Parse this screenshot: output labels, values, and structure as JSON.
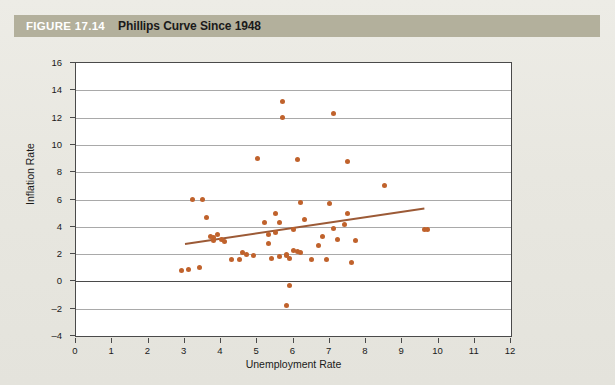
{
  "figure": {
    "label": "FIGURE 17.14",
    "title": "Phillips Curve Since 1948"
  },
  "colors": {
    "title_bar": "#b3b09c",
    "point": "#c0622c",
    "trend_line": "#9c5a36",
    "grid": "#a9a9a9",
    "axis": "#4a4a4a",
    "panel": "#ffffff",
    "page": "#e9e8e1"
  },
  "chart_data": {
    "type": "scatter",
    "title": "Phillips Curve Since 1948",
    "xlabel": "Unemployment Rate",
    "ylabel": "Inflation Rate",
    "xlim": [
      0,
      12
    ],
    "ylim": [
      -4,
      16
    ],
    "xticks": [
      0,
      1,
      2,
      3,
      4,
      5,
      6,
      7,
      8,
      9,
      10,
      11,
      12
    ],
    "yticks": [
      -4,
      -2,
      0,
      2,
      4,
      6,
      8,
      10,
      12,
      14,
      16
    ],
    "grid": "horizontal",
    "legend": null,
    "series": [
      {
        "name": "Annual observations",
        "marker": "circle",
        "color": "#c0622c",
        "points": [
          [
            2.9,
            0.8
          ],
          [
            3.1,
            0.9
          ],
          [
            3.2,
            6.0
          ],
          [
            3.4,
            1.0
          ],
          [
            3.5,
            6.0
          ],
          [
            3.6,
            4.7
          ],
          [
            3.7,
            3.3
          ],
          [
            3.8,
            3.2
          ],
          [
            3.8,
            3.0
          ],
          [
            3.9,
            3.4
          ],
          [
            4.0,
            3.1
          ],
          [
            4.1,
            2.9
          ],
          [
            4.3,
            1.6
          ],
          [
            4.5,
            1.6
          ],
          [
            4.6,
            2.1
          ],
          [
            4.7,
            2.0
          ],
          [
            4.9,
            1.9
          ],
          [
            5.0,
            9.0
          ],
          [
            5.2,
            4.3
          ],
          [
            5.3,
            3.4
          ],
          [
            5.3,
            2.8
          ],
          [
            5.4,
            1.7
          ],
          [
            5.5,
            5.0
          ],
          [
            5.5,
            3.6
          ],
          [
            5.6,
            4.3
          ],
          [
            5.6,
            1.8
          ],
          [
            5.7,
            13.2
          ],
          [
            5.7,
            12.0
          ],
          [
            5.8,
            1.9
          ],
          [
            5.8,
            2.0
          ],
          [
            5.9,
            1.7
          ],
          [
            5.9,
            -0.3
          ],
          [
            6.0,
            3.8
          ],
          [
            6.0,
            2.3
          ],
          [
            6.1,
            8.9
          ],
          [
            6.1,
            2.2
          ],
          [
            6.2,
            2.1
          ],
          [
            6.2,
            5.8
          ],
          [
            6.3,
            4.5
          ],
          [
            6.5,
            1.6
          ],
          [
            6.7,
            2.6
          ],
          [
            6.8,
            3.3
          ],
          [
            6.9,
            1.6
          ],
          [
            7.0,
            5.7
          ],
          [
            7.1,
            12.3
          ],
          [
            7.1,
            3.9
          ],
          [
            7.2,
            3.1
          ],
          [
            7.4,
            4.2
          ],
          [
            7.5,
            8.8
          ],
          [
            7.5,
            5.0
          ],
          [
            7.6,
            1.4
          ],
          [
            7.7,
            3.0
          ],
          [
            8.5,
            7.0
          ],
          [
            9.6,
            3.8
          ],
          [
            9.7,
            3.8
          ],
          [
            5.8,
            -1.8
          ]
        ]
      }
    ],
    "trend": {
      "name": "Fitted trend",
      "color": "#9c5a36",
      "x0": 3.0,
      "y0": 2.8,
      "x1": 9.6,
      "y1": 5.4
    }
  }
}
